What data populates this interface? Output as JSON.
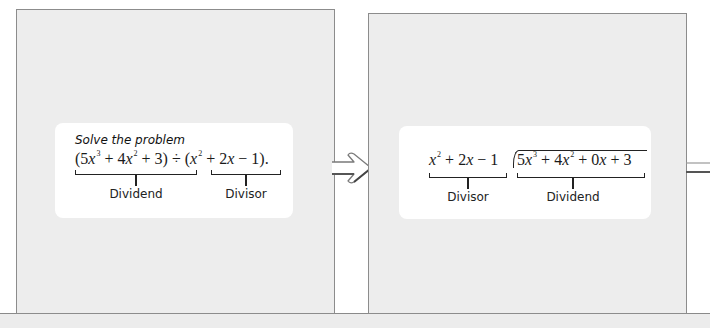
{
  "left_panel": {
    "prompt": "Solve the problem",
    "expression": {
      "dividend_parts": [
        "(5",
        "x",
        "3",
        " + 4",
        "x",
        "2",
        " + 3)"
      ],
      "operator": " ÷ ",
      "divisor_parts": [
        "(",
        "x",
        "2",
        " + 2",
        "x",
        " − 1)"
      ],
      "terminator": "."
    },
    "labels": {
      "dividend": "Dividend",
      "divisor": "Divisor"
    }
  },
  "right_panel": {
    "divisor_text": {
      "a": "x",
      "a_exp": "2",
      "rest1": " + 2",
      "b": "x",
      "rest2": " − 1"
    },
    "dividend_text": {
      "c": "5",
      "d": "x",
      "d_exp": "3",
      "e": " + 4",
      "f": "x",
      "f_exp": "2",
      "g": " + 0",
      "h": "x",
      "k": " + 3"
    },
    "labels": {
      "divisor": "Divisor",
      "dividend": "Dividend"
    }
  },
  "colors": {
    "panel_bg": "#ededed",
    "panel_border": "#8c8c8c",
    "card_bg": "#ffffff",
    "text": "#1a1a1a"
  }
}
